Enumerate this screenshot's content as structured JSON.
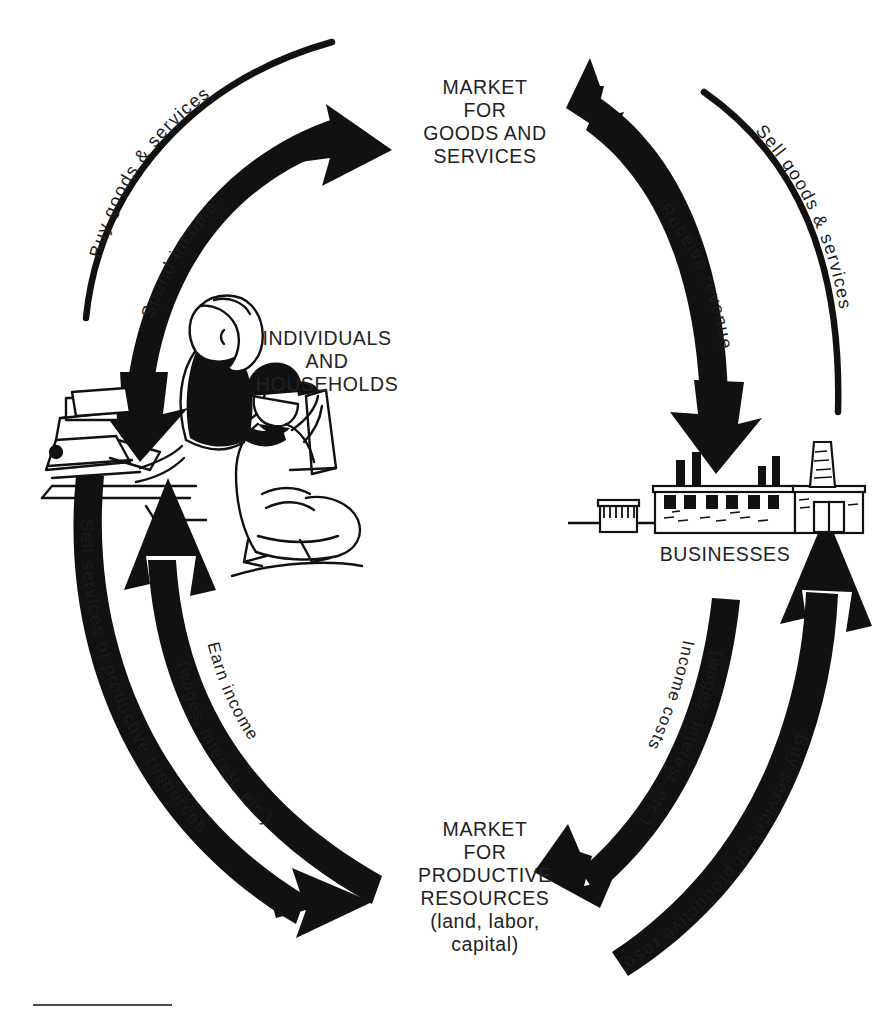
{
  "diagram": {
    "type": "circular-flow",
    "nodes": [
      {
        "id": "market-goods",
        "label": "MARKET\nFOR\nGOODS AND\nSERVICES",
        "position": "top"
      },
      {
        "id": "households",
        "label": "INDIVIDUALS\nAND\nHOUSEHOLDS",
        "position": "left"
      },
      {
        "id": "businesses",
        "label": "BUSINESSES",
        "position": "right"
      },
      {
        "id": "market-resources",
        "label": "MARKET\nFOR\nPRODUCTIVE\nRESOURCES\n(land, labor,\ncapital)",
        "position": "bottom"
      }
    ],
    "flows": [
      {
        "id": "buy-goods-services",
        "label": "Buy goods & services",
        "from": "households",
        "to": "market-goods",
        "quadrant": "top-left",
        "ring": "outer",
        "style": "thin-line"
      },
      {
        "id": "spend-income",
        "label": "Spend income",
        "from": "households",
        "to": "market-goods",
        "quadrant": "top-left",
        "ring": "inner",
        "style": "thick-arrow"
      },
      {
        "id": "sell-goods-services",
        "label": "Sell goods & services",
        "from": "businesses",
        "to": "market-goods",
        "quadrant": "top-right",
        "ring": "outer",
        "style": "thin-line"
      },
      {
        "id": "receive-revenue",
        "label": "Receive revenue",
        "from": "market-goods",
        "to": "businesses",
        "quadrant": "top-right",
        "ring": "inner",
        "style": "thick-arrow"
      },
      {
        "id": "sell-services-prod",
        "label": "Sell services of productive resources",
        "from": "households",
        "to": "market-resources",
        "quadrant": "bottom-left",
        "ring": "outer",
        "style": "thick-arrow"
      },
      {
        "id": "earn-income",
        "label": "Earn income\n(wages, interest, etc.)",
        "from": "market-resources",
        "to": "households",
        "quadrant": "bottom-left",
        "ring": "inner",
        "style": "thick-arrow"
      },
      {
        "id": "income-costs",
        "label": "Income costs\n(wages, interest, etc.)",
        "from": "businesses",
        "to": "market-resources",
        "quadrant": "bottom-right",
        "ring": "inner",
        "style": "thick-arrow"
      },
      {
        "id": "buy-services-prod",
        "label": "Buy services of productive resources",
        "from": "market-resources",
        "to": "businesses",
        "quadrant": "bottom-right",
        "ring": "outer",
        "style": "thick-arrow"
      }
    ],
    "flow_labels": {
      "buy_goods_services": "Buy goods & services",
      "spend_income": "Spend income",
      "sell_goods_services": "Sell goods & services",
      "receive_revenue": "Receive revenue",
      "sell_services_productive_resources": "Sell services of productive resources",
      "earn_income_line1": "Earn income",
      "earn_income_line2": "(wages, interest, etc.)",
      "income_costs_line1": "Income costs",
      "income_costs_line2": "(wages, interest, etc.)",
      "buy_services_productive_resources": "Buy services of productive resources"
    },
    "node_labels": {
      "market_goods": "MARKET\nFOR\nGOODS AND\nSERVICES",
      "households": "INDIVIDUALS\nAND\nHOUSEHOLDS",
      "businesses": "BUSINESSES",
      "market_resources": "MARKET\nFOR\nPRODUCTIVE\nRESOURCES\n(land, labor,\ncapital)"
    },
    "illustrations": [
      {
        "id": "household-illustration",
        "name": "woman-typing-and-person-reading",
        "description": "Line drawing of a woman at a typewriter desk and a person kneeling with a book"
      },
      {
        "id": "business-illustration",
        "name": "factory-building",
        "description": "Line drawing of a factory with smokestacks, windows and doors"
      }
    ],
    "colors": {
      "ink": "#1a1a1a",
      "arrow": "#111111",
      "background": "#ffffff",
      "rule": "#4a4a4a"
    }
  }
}
